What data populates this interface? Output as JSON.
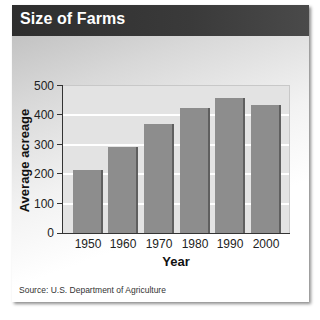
{
  "header": {
    "title": "Size of Farms"
  },
  "source": "Source: U.S. Department of Agriculture",
  "colors": {
    "header_bg": "#333333",
    "bar": "#8d8d8d",
    "bar_edge": "#5f5f5f",
    "plot_bg": "#e3e3e3",
    "gridline": "#ffffff"
  },
  "axis": {
    "xlabel": "Year",
    "ylabel": "Average acreage",
    "yticks": [
      "0",
      "100",
      "200",
      "300",
      "400",
      "500"
    ],
    "xticks": [
      "1950",
      "1960",
      "1970",
      "1980",
      "1990",
      "2000"
    ]
  },
  "chart_data": {
    "type": "bar",
    "title": "Size of Farms",
    "categories": [
      "1950",
      "1960",
      "1970",
      "1980",
      "1990",
      "2000"
    ],
    "values": [
      215,
      295,
      370,
      425,
      460,
      435
    ],
    "xlabel": "Year",
    "ylabel": "Average acreage",
    "ylim": [
      0,
      500
    ],
    "yticks": [
      0,
      100,
      200,
      300,
      400,
      500
    ],
    "grid": true,
    "legend": null,
    "source": "Source: U.S. Department of Agriculture"
  }
}
